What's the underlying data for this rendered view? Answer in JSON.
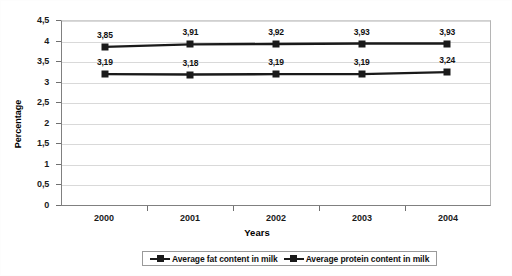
{
  "chart_data": {
    "type": "line",
    "title": "",
    "xlabel": "Years",
    "ylabel": "Percentage",
    "categories": [
      "2000",
      "2001",
      "2002",
      "2003",
      "2004"
    ],
    "ylim": [
      0,
      4.5
    ],
    "ytick_labels": [
      "4,5",
      "4",
      "3,5",
      "3",
      "2,5",
      "2",
      "1,5",
      "1",
      "0,5",
      "0"
    ],
    "ytick_values": [
      4.5,
      4,
      3.5,
      3,
      2.5,
      2,
      1.5,
      1,
      0.5,
      0
    ],
    "grid": true,
    "legend_position": "bottom",
    "decimal_separator": ",",
    "marker": "square",
    "series": [
      {
        "name": "Average fat content in milk",
        "color": "#1a1a1a",
        "values": [
          3.85,
          3.91,
          3.92,
          3.93,
          3.93
        ],
        "labels": [
          "3,85",
          "3,91",
          "3,92",
          "3,93",
          "3,93"
        ]
      },
      {
        "name": "Average protein content in milk",
        "color": "#1a1a1a",
        "values": [
          3.19,
          3.18,
          3.19,
          3.19,
          3.24
        ],
        "labels": [
          "3,19",
          "3,18",
          "3,19",
          "3,19",
          "3,24"
        ]
      }
    ]
  }
}
